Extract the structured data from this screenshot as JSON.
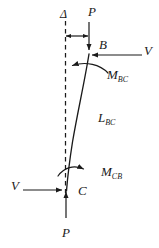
{
  "diagram": {
    "stroke_color": "#1a1a1a",
    "background_color": "#ffffff",
    "labels": {
      "delta": "Δ",
      "axial_load_top": "P",
      "axial_load_bottom": "P",
      "joint_top": "B",
      "joint_bottom": "C",
      "shear_top": "V",
      "shear_bottom": "V",
      "moment_bc_base": "M",
      "moment_bc_sub": "BC",
      "moment_cb_base": "M",
      "moment_cb_sub": "CB",
      "length_base": "L",
      "length_sub": "BC"
    }
  }
}
